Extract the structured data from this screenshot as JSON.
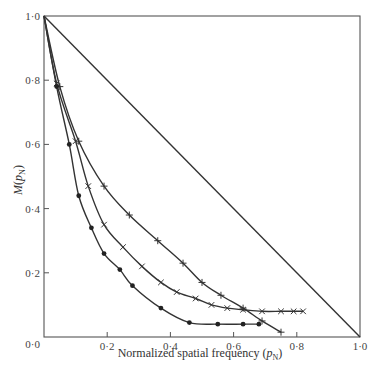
{
  "chart_data": {
    "type": "line",
    "title": "",
    "xlabel": "Normalized spatial frequency (p_N)",
    "xlabel_main": "Normalized spatial frequency (",
    "xlabel_var": "p",
    "xlabel_sub": "N",
    "xlabel_close": ")",
    "ylabel": "M(p_N)",
    "ylabel_main": "M(",
    "ylabel_var": "p",
    "ylabel_sub": "N",
    "ylabel_close": ")",
    "xlim": [
      0,
      1
    ],
    "ylim": [
      0,
      1
    ],
    "x_ticks": [
      0.2,
      0.4,
      0.6,
      0.8
    ],
    "x_tick_labels": [
      "0·2",
      "0·4",
      "0·6",
      "0·8"
    ],
    "x_origin_label": "0·0",
    "x_end_label": "1·0",
    "y_ticks": [
      0.2,
      0.4,
      0.6,
      0.8
    ],
    "y_tick_labels": [
      "0·2",
      "0·4",
      "0·6",
      "0·8"
    ],
    "y_end_label": "1·0",
    "grid": false,
    "legend": null,
    "series": [
      {
        "name": "diffraction-limit (straight line)",
        "marker": "none",
        "x": [
          0,
          1
        ],
        "y": [
          1,
          0
        ]
      },
      {
        "name": "plus-marker series",
        "marker": "+",
        "x": [
          0,
          0.05,
          0.11,
          0.19,
          0.27,
          0.36,
          0.44,
          0.5,
          0.56,
          0.63,
          0.69,
          0.75
        ],
        "y": [
          1,
          0.78,
          0.61,
          0.47,
          0.38,
          0.3,
          0.23,
          0.17,
          0.13,
          0.09,
          0.05,
          0.015
        ]
      },
      {
        "name": "x-marker series",
        "marker": "x",
        "x": [
          0,
          0.04,
          0.1,
          0.14,
          0.19,
          0.25,
          0.31,
          0.37,
          0.42,
          0.48,
          0.53,
          0.58,
          0.63,
          0.69,
          0.75,
          0.79,
          0.82
        ],
        "y": [
          1,
          0.79,
          0.61,
          0.47,
          0.35,
          0.28,
          0.22,
          0.17,
          0.14,
          0.12,
          0.1,
          0.09,
          0.085,
          0.08,
          0.08,
          0.08,
          0.08
        ]
      },
      {
        "name": "dot-marker series",
        "marker": "dot",
        "x": [
          0,
          0.04,
          0.08,
          0.11,
          0.15,
          0.19,
          0.24,
          0.28,
          0.37,
          0.46,
          0.55,
          0.63,
          0.68
        ],
        "y": [
          1,
          0.78,
          0.6,
          0.44,
          0.34,
          0.26,
          0.21,
          0.16,
          0.09,
          0.045,
          0.04,
          0.04,
          0.04
        ]
      }
    ]
  }
}
